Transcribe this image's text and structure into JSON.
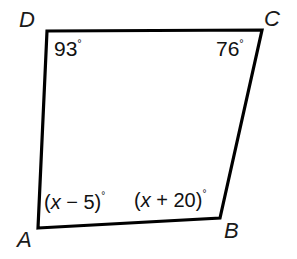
{
  "figure": {
    "type": "quadrilateral-angle-diagram",
    "shape_name": "ABCD",
    "background_color": "#ffffff",
    "stroke_color": "#000000",
    "text_color": "#111111",
    "vertices": [
      {
        "name": "A",
        "label": "A",
        "x": 38,
        "y": 228
      },
      {
        "name": "B",
        "label": "B",
        "x": 220,
        "y": 218
      },
      {
        "name": "C",
        "label": "C",
        "x": 262,
        "y": 30
      },
      {
        "name": "D",
        "label": "D",
        "x": 47,
        "y": 31
      }
    ],
    "angles": [
      {
        "at": "D",
        "value": "93",
        "unit": "°",
        "kind": "numeric"
      },
      {
        "at": "C",
        "value": "76",
        "unit": "°",
        "kind": "numeric"
      },
      {
        "at": "A",
        "expr_open": "(",
        "expr_var": "x",
        "expr_op": " − ",
        "expr_num": "5",
        "expr_close": ")",
        "unit": "°",
        "kind": "expression",
        "full": "(x − 5)°"
      },
      {
        "at": "B",
        "expr_open": "(",
        "expr_var": "x",
        "expr_op": " + ",
        "expr_num": "20",
        "expr_close": ")",
        "unit": "°",
        "kind": "expression",
        "full": "(x + 20)°"
      }
    ]
  }
}
